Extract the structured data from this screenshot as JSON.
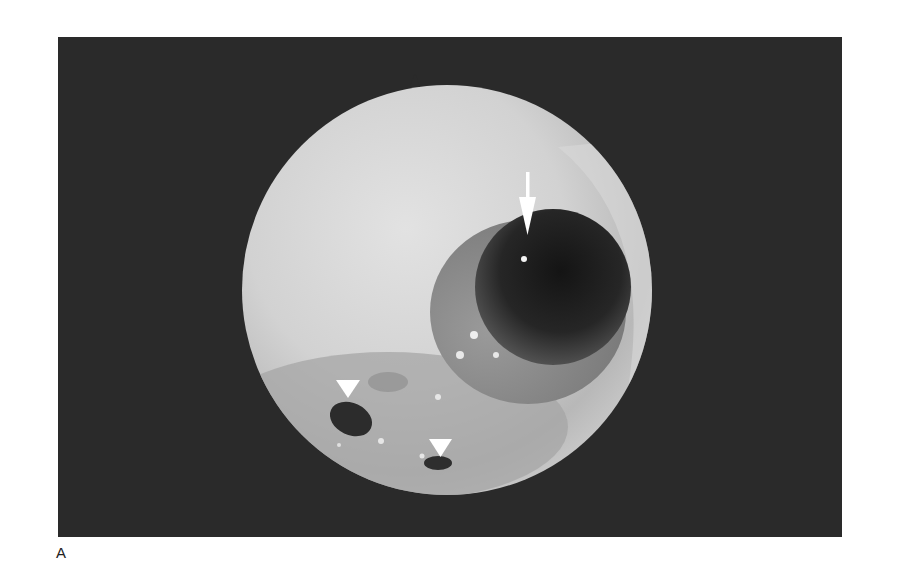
{
  "figure": {
    "panel_label": "A",
    "image_description": "Endoscopic circular view with a dark lumen opening marked by an arrow and two smaller dark openings marked by arrowheads",
    "annotations": [
      {
        "type": "arrow",
        "direction": "down",
        "color": "#ffffff"
      },
      {
        "type": "arrowhead",
        "direction": "down",
        "color": "#ffffff"
      },
      {
        "type": "arrowhead",
        "direction": "down",
        "color": "#ffffff"
      }
    ],
    "colors": {
      "background_panel": "#2a2a2a",
      "view_light": "#dcdcdc",
      "view_mid": "#a9a9a9",
      "lumen_dark": "#1e1e1e",
      "page": "#ffffff"
    }
  }
}
